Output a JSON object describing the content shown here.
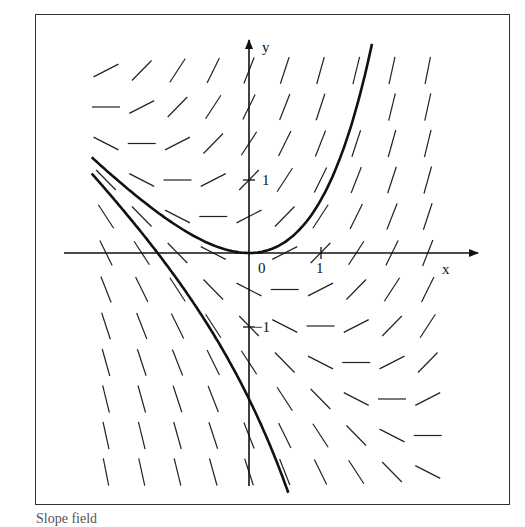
{
  "figure": {
    "type": "slope-field",
    "equation_implied": "dy/dx = x + y",
    "axis_labels": {
      "x": "x",
      "y": "y"
    },
    "tick_labels": {
      "origin": "0",
      "x_one": "1",
      "y_one": "1",
      "y_minus_one": "−1"
    },
    "colors": {
      "ink": "#111111",
      "frame": "#333333",
      "background": "#ffffff"
    }
  },
  "chart_data": {
    "type": "slope-field",
    "title": "",
    "xlabel": "x",
    "ylabel": "y",
    "x_ticks": [
      {
        "value": 0,
        "label": "0"
      },
      {
        "value": 1,
        "label": "1"
      }
    ],
    "y_ticks": [
      {
        "value": 1,
        "label": "1"
      },
      {
        "value": -1,
        "label": "−1"
      }
    ],
    "grid": {
      "x": [
        -2,
        -1.5,
        -1,
        -0.5,
        0,
        0.5,
        1,
        1.5,
        2,
        2.5
      ],
      "y": [
        2.5,
        2,
        1.5,
        1,
        0.5,
        0,
        -0.5,
        -1,
        -1.5,
        -2,
        -2.5,
        -3
      ],
      "slope_formula": "x + y"
    },
    "solution_curves": [
      {
        "name": "y = e^x − x − 1",
        "C": 1,
        "x_range": [
          -2.2,
          1.72
        ]
      },
      {
        "name": "y = −e^x − x − 1",
        "C": -1,
        "x_range": [
          -2.2,
          0.55
        ]
      }
    ],
    "xlim": [
      -2.6,
      3.2
    ],
    "ylim": [
      -3.2,
      2.9
    ],
    "grid_on": false,
    "legend": null
  },
  "caption": {
    "visible_text": "Slope field"
  }
}
